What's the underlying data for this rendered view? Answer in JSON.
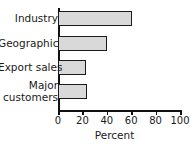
{
  "chart_data": {
    "type": "bar",
    "orientation": "horizontal",
    "title": "",
    "xlabel": "Percent",
    "ylabel": "",
    "categories": [
      "Industry",
      "Geographic",
      "Export sales",
      "Major customers"
    ],
    "values": [
      61,
      40,
      23,
      24
    ],
    "xlim": [
      0,
      100
    ],
    "xticks": [
      0,
      20,
      40,
      60,
      80,
      100
    ],
    "xtick_labels": [
      "0",
      "20",
      "40",
      "60",
      "80",
      "100"
    ],
    "grid": false,
    "legend": null,
    "bar_fill_color": "#d9d9d9",
    "bar_edge_color": "#1a1a1a",
    "axis_color": "#111111",
    "background_color": "#ffffff"
  },
  "labels": {
    "category_0": "Industry",
    "category_1": "Geographic",
    "category_2": "Export sales",
    "category_3_line1": "Major",
    "category_3_line2": "customers",
    "tick_0": "0",
    "tick_1": "20",
    "tick_2": "40",
    "tick_3": "60",
    "tick_4": "80",
    "tick_5": "100",
    "axis_title": "Percent",
    "clipped_top_text": ""
  }
}
